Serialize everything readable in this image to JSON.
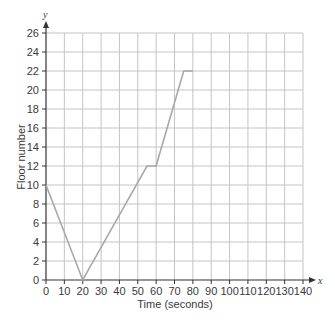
{
  "chart_data": {
    "type": "line",
    "title": "",
    "xlabel": "Time (seconds)",
    "ylabel": "Floor number",
    "x_axis_variable": "x",
    "y_axis_variable": "y",
    "xlim": [
      0,
      140
    ],
    "ylim": [
      0,
      26
    ],
    "x_ticks": [
      0,
      10,
      20,
      30,
      40,
      50,
      60,
      70,
      80,
      90,
      100,
      110,
      120,
      130,
      140
    ],
    "y_ticks": [
      0,
      2,
      4,
      6,
      8,
      10,
      12,
      14,
      16,
      18,
      20,
      22,
      24,
      26
    ],
    "grid": true,
    "legend": null,
    "series": [
      {
        "name": "Floor number",
        "x": [
          0,
          20,
          55,
          60,
          75,
          80
        ],
        "y": [
          10,
          0,
          12,
          12,
          22,
          22
        ]
      }
    ]
  },
  "colors": {
    "grid": "#c4c4c4",
    "axis": "#333333",
    "line": "#a8a8a8",
    "text": "#3a3a3a"
  }
}
